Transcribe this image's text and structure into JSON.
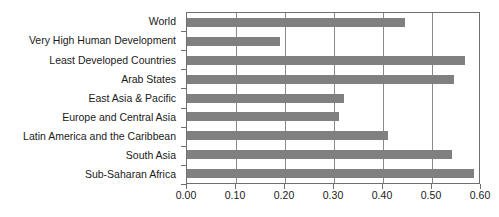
{
  "chart_data": {
    "type": "bar",
    "orientation": "horizontal",
    "title": "",
    "xlabel": "",
    "ylabel": "",
    "xlim": [
      0.0,
      0.6
    ],
    "xticks": [
      0.0,
      0.1,
      0.2,
      0.3,
      0.4,
      0.5,
      0.6
    ],
    "xtick_labels": [
      "0.00",
      "0.10",
      "0.20",
      "0.30",
      "0.40",
      "0.50",
      "0.60"
    ],
    "grid": true,
    "grid_axis": "x",
    "legend": false,
    "bar_color": "#808080",
    "axis_color": "#6f6f6f",
    "categories": [
      "World",
      "Very High Human Development",
      "Least Developed Countries",
      "Arab States",
      "East Asia & Pacific",
      "Europe and Central Asia",
      "Latin America and the Caribbean",
      "South Asia",
      "Sub-Saharan Africa"
    ],
    "values": [
      0.445,
      0.19,
      0.567,
      0.545,
      0.32,
      0.31,
      0.41,
      0.54,
      0.585
    ]
  }
}
